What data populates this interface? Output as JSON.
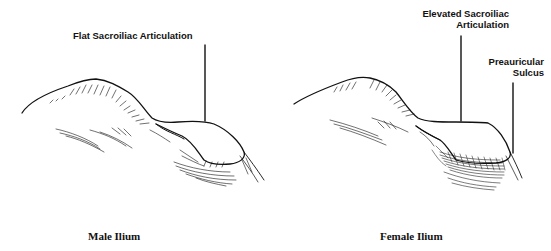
{
  "figure": {
    "panels": [
      {
        "id": "male",
        "caption": "Male Ilium",
        "annotations": [
          {
            "label": "Flat Sacroiliac Articulation"
          }
        ]
      },
      {
        "id": "female",
        "caption": "Female Ilium",
        "annotations": [
          {
            "label_line1": "Elevated Sacroiliac",
            "label_line2": "Articulation"
          },
          {
            "label_line1": "Preauricular",
            "label_line2": "Sucus_placeholder"
          }
        ]
      }
    ]
  },
  "labels": {
    "male_articulation": "Flat Sacroiliac Articulation",
    "female_articulation_line1": "Elevated Sacroiliac",
    "female_articulation_line2": "Articulation",
    "preauricular_line1": "Preauricular",
    "preauricular_line2": "Sulcus",
    "male_caption": "Male Ilium",
    "female_caption": "Female Ilium"
  },
  "colors": {
    "ink": "#111111",
    "background": "#ffffff"
  }
}
